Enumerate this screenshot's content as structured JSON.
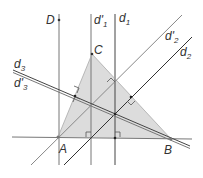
{
  "diagram": {
    "type": "geometry",
    "colors": {
      "triangle_fill": "#dcdcdc",
      "line_dark": "#333333",
      "line_light": "#888888"
    },
    "points": [
      {
        "name": "A",
        "label": "A"
      },
      {
        "name": "B",
        "label": "B"
      },
      {
        "name": "C",
        "label": "C"
      },
      {
        "name": "D",
        "label": "D"
      }
    ],
    "lines": [
      {
        "name": "d1",
        "base": "d",
        "sub": "1",
        "prime": ""
      },
      {
        "name": "d'1",
        "base": "d",
        "sub": "1",
        "prime": "'"
      },
      {
        "name": "d2",
        "base": "d",
        "sub": "2",
        "prime": ""
      },
      {
        "name": "d'2",
        "base": "d",
        "sub": "2",
        "prime": "'"
      },
      {
        "name": "d3",
        "base": "d",
        "sub": "3",
        "prime": ""
      },
      {
        "name": "d'3",
        "base": "d",
        "sub": "3",
        "prime": "'"
      }
    ]
  }
}
